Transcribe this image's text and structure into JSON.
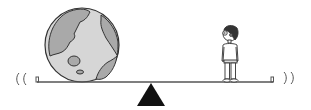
{
  "scene": {
    "description": "Seesaw balancing the Earth on the left against a small boy on the right",
    "colors": {
      "background": "#ffffff",
      "outline": "#333333",
      "earth_ocean": "#d6d6d6",
      "earth_land": "#a9a9a9",
      "fulcrum": "#111111",
      "beam": "#555555",
      "hair": "#333333",
      "skin": "#9a9a9a"
    },
    "objects": {
      "left_load": "earth",
      "right_load": "person",
      "pivot": "triangle-fulcrum",
      "motion_marks_left": "((",
      "motion_marks_right": "))"
    }
  }
}
